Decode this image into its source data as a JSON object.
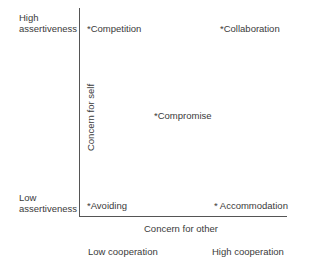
{
  "diagram": {
    "type": "conflict-styles-grid",
    "y_axis": {
      "label": "Concern for self",
      "high_label_line1": "High",
      "high_label_line2": "assertiveness",
      "low_label_line1": "Low",
      "low_label_line2": "assertiveness"
    },
    "x_axis": {
      "label": "Concern for other",
      "low_label": "Low cooperation",
      "high_label": "High cooperation"
    },
    "styles": [
      {
        "label": "*Competition",
        "position": "top-left"
      },
      {
        "label": "*Collaboration",
        "position": "top-right"
      },
      {
        "label": "*Compromise",
        "position": "center"
      },
      {
        "label": "*Avoiding",
        "position": "bottom-left"
      },
      {
        "label": "* Accommodation",
        "position": "bottom-right"
      }
    ]
  }
}
